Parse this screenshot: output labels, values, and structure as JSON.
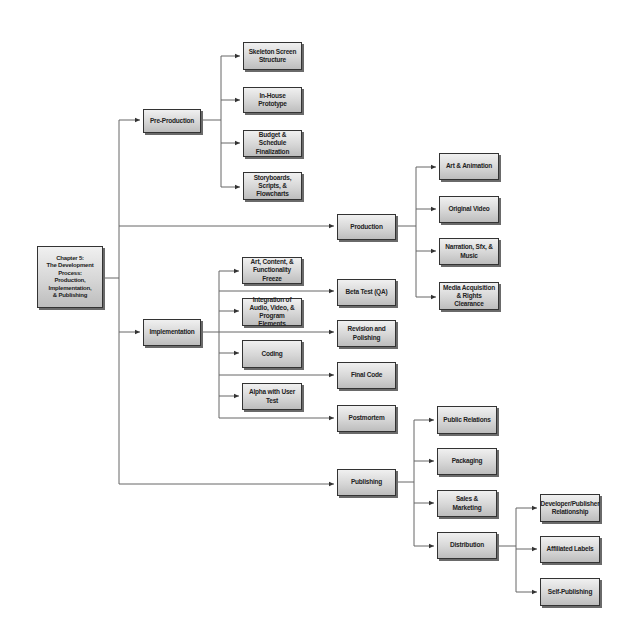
{
  "diagram": {
    "root": {
      "label": "Chapter 5:\nThe Development Process:\nProduction,\nImplementation,\n& Publishing"
    },
    "branches": [
      {
        "label": "Pre-Production",
        "children": [
          {
            "label": "Skeleton Screen Structure"
          },
          {
            "label": "In-House Prototype"
          },
          {
            "label": "Budget & Schedule Finalization"
          },
          {
            "label": "Storyboards, Scripts, & Flowcharts"
          }
        ]
      },
      {
        "label": "Production",
        "children": [
          {
            "label": "Art & Animation"
          },
          {
            "label": "Original Video"
          },
          {
            "label": "Narration, Sfx, & Music"
          },
          {
            "label": "Media Acquisition & Rights Clearance"
          }
        ]
      },
      {
        "label": "Implementation",
        "children": [
          {
            "label": "Art, Content, & Functionality Freeze"
          },
          {
            "label": "Beta Test (QA)"
          },
          {
            "label": "Integration of Audio, Video, & Program Elements"
          },
          {
            "label": "Revision and Polishing"
          },
          {
            "label": "Coding"
          },
          {
            "label": "Final Code"
          },
          {
            "label": "Alpha with User Test"
          },
          {
            "label": "Postmortem"
          }
        ]
      },
      {
        "label": "Publishing",
        "children": [
          {
            "label": "Public Relations"
          },
          {
            "label": "Packaging"
          },
          {
            "label": "Sales & Marketing"
          },
          {
            "label": "Distribution",
            "children": [
              {
                "label": "Developer/Publisher Relationship"
              },
              {
                "label": "Affiliated Labels"
              },
              {
                "label": "Self-Publishing"
              }
            ]
          }
        ]
      }
    ]
  },
  "colors": {
    "line": "#555555",
    "box_border": "#333333",
    "box_fill_top": "#f0f0f0",
    "box_fill_bottom": "#bdbdbd",
    "shadow": "#6a6a6a"
  }
}
